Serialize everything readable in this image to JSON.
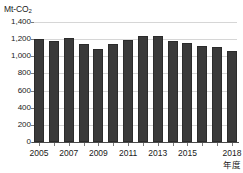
{
  "legend_crop": {
    "fragment_1": "",
    "fragment_2": "",
    "fragment_3": ""
  },
  "unit_label": {
    "prefix": "Mt-CO",
    "subscript": "2"
  },
  "axis_title_x": "年度",
  "chart_data": {
    "type": "bar",
    "title": "",
    "subtitle": "",
    "xlabel": "年度",
    "ylabel": "Mt-CO2",
    "ylim": [
      0,
      1400
    ],
    "ytick_step": 200,
    "ytick_labels": [
      "1,400",
      "1,200",
      "1,000",
      "800",
      "600",
      "400",
      "200",
      "0"
    ],
    "ytick_values": [
      1400,
      1200,
      1000,
      800,
      600,
      400,
      200,
      0
    ],
    "xtick_labels": [
      "2005",
      "2007",
      "2009",
      "2011",
      "2013",
      "2015",
      "2018"
    ],
    "xtick_categories": [
      "2005",
      "2007",
      "2009",
      "2011",
      "2013",
      "2015",
      "2018"
    ],
    "grid": true,
    "legend": "none",
    "bar_color": "#3a3a3a",
    "grid_color": "#d6d6d6",
    "axis_color": "#4a4a4a",
    "categories": [
      "2005",
      "2006",
      "2007",
      "2008",
      "2009",
      "2010",
      "2011",
      "2012",
      "2013",
      "2014",
      "2015",
      "2016",
      "2017",
      "2018"
    ],
    "values": [
      1197,
      1178,
      1213,
      1148,
      1080,
      1147,
      1190,
      1232,
      1241,
      1177,
      1154,
      1123,
      1111,
      1064
    ],
    "series": [
      {
        "name": "CO2",
        "values": [
          1197,
          1178,
          1213,
          1148,
          1080,
          1147,
          1190,
          1232,
          1241,
          1177,
          1154,
          1123,
          1111,
          1064
        ]
      }
    ]
  }
}
